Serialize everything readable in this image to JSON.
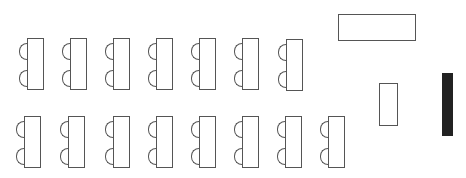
{
  "diagram": {
    "type": "classroom-seating-layout",
    "colors": {
      "line": "#555555",
      "background": "#ffffff",
      "solid": "#222222"
    },
    "rows": [
      {
        "name": "row-1",
        "desks": [
          {
            "x": 19,
            "y": 38,
            "chairs": 2
          },
          {
            "x": 62,
            "y": 38,
            "chairs": 2
          },
          {
            "x": 105,
            "y": 38,
            "chairs": 2
          },
          {
            "x": 148,
            "y": 38,
            "chairs": 2
          },
          {
            "x": 191,
            "y": 38,
            "chairs": 2
          },
          {
            "x": 234,
            "y": 38,
            "chairs": 2
          },
          {
            "x": 278,
            "y": 39,
            "chairs": 2
          }
        ]
      },
      {
        "name": "row-2",
        "desks": [
          {
            "x": 16,
            "y": 116,
            "chairs": 2
          },
          {
            "x": 60,
            "y": 116,
            "chairs": 2
          },
          {
            "x": 105,
            "y": 116,
            "chairs": 2
          },
          {
            "x": 148,
            "y": 116,
            "chairs": 2
          },
          {
            "x": 191,
            "y": 116,
            "chairs": 2
          },
          {
            "x": 234,
            "y": 116,
            "chairs": 2
          },
          {
            "x": 277,
            "y": 116,
            "chairs": 2
          },
          {
            "x": 320,
            "y": 116,
            "chairs": 2
          }
        ]
      }
    ],
    "fixtures": [
      {
        "name": "teacher-desk",
        "x": 338,
        "y": 14,
        "w": 78,
        "h": 27,
        "style": "outline"
      },
      {
        "name": "lectern",
        "x": 379,
        "y": 83,
        "w": 19,
        "h": 43,
        "style": "outline"
      },
      {
        "name": "board",
        "x": 442,
        "y": 73,
        "w": 11,
        "h": 63,
        "style": "solid"
      }
    ]
  }
}
